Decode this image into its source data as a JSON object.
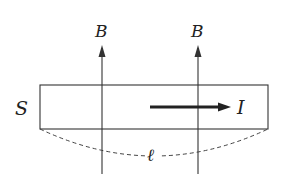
{
  "diagram": {
    "colors": {
      "stroke": "#333333",
      "text": "#222222",
      "background": "#ffffff"
    },
    "labels": {
      "field_left": "B",
      "field_right": "B",
      "slab": "S",
      "current": "I",
      "length": "ℓ"
    },
    "elements": {
      "slab_rect": {
        "x": 40,
        "y": 85,
        "width": 228,
        "height": 44
      },
      "field_lines": [
        {
          "x": 102,
          "y_top": 46,
          "y_bottom": 174,
          "direction": "up"
        },
        {
          "x": 198,
          "y_top": 46,
          "y_bottom": 174,
          "direction": "up"
        }
      ],
      "current_arrow": {
        "x1": 150,
        "x2": 230,
        "y": 107,
        "direction": "right"
      },
      "length_curve": {
        "style": "dashed",
        "from": [
          40,
          129
        ],
        "to": [
          268,
          129
        ],
        "low_point_y": 156
      }
    }
  }
}
